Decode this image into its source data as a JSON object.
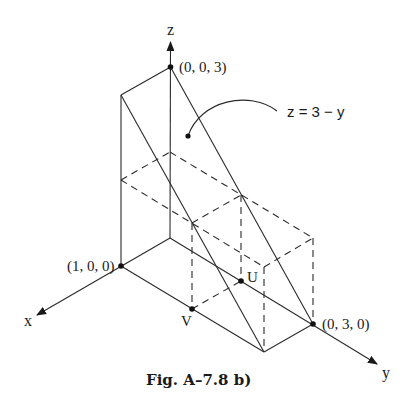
{
  "figure": {
    "caption": "Fig.  A–7.8 b)",
    "axes": {
      "x_label": "x",
      "y_label": "y",
      "z_label": "z"
    },
    "points": {
      "z_intercept": "(0, 0, 3)",
      "x_point": "(1, 0, 0)",
      "y_intercept": "(0, 3, 0)",
      "U": "U",
      "V": "V"
    },
    "plane_label": "z = 3 − y",
    "colors": {
      "line": "#2a2a2a",
      "background": "#ffffff"
    }
  }
}
